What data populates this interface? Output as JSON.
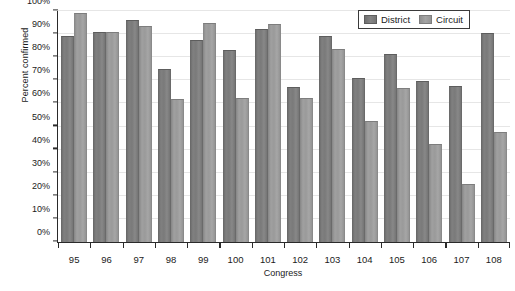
{
  "chart_data": {
    "type": "bar",
    "title": "",
    "xlabel": "Congress",
    "ylabel": "Percent confirmed",
    "ylim": [
      0,
      100
    ],
    "yticks": [
      "0%",
      "10%",
      "20%",
      "30%",
      "40%",
      "50%",
      "60%",
      "70%",
      "80%",
      "90%",
      "100%"
    ],
    "ytick_values": [
      0,
      10,
      20,
      30,
      40,
      50,
      60,
      70,
      80,
      90,
      100
    ],
    "grid": true,
    "legend_position": "top-right",
    "categories": [
      "95",
      "96",
      "97",
      "98",
      "99",
      "100",
      "101",
      "102",
      "103",
      "104",
      "105",
      "106",
      "107",
      "108"
    ],
    "series": [
      {
        "name": "District",
        "color": "#7a7a7a",
        "values": [
          89,
          91,
          96,
          75,
          87.5,
          83,
          92,
          67,
          89,
          71,
          81.5,
          69.5,
          67.5,
          90.5
        ]
      },
      {
        "name": "Circuit",
        "color": "#9a9a9a",
        "values": [
          99,
          91,
          93.5,
          62,
          95,
          62.5,
          94.5,
          62.5,
          83.5,
          52.5,
          66.5,
          42.5,
          25,
          47.5
        ]
      }
    ]
  }
}
